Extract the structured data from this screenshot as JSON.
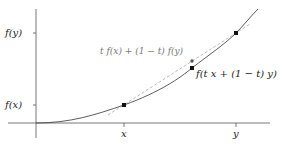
{
  "figure": {
    "axes": {
      "y_ticks": [
        {
          "label": "f(y)",
          "y": 33
        },
        {
          "label": "f(x)",
          "y": 105
        }
      ],
      "x_ticks": [
        {
          "label": "x",
          "x": 124
        },
        {
          "label": "y",
          "x": 236
        }
      ]
    },
    "annotations": {
      "chord_label": "t f(x) + (1 − t) f(y)",
      "curve_label": "f(t x + (1 − t) y)"
    },
    "points": [
      {
        "name": "x-fx",
        "x": 124,
        "y": 105
      },
      {
        "name": "y-fy",
        "x": 236,
        "y": 33
      },
      {
        "name": "chord-point",
        "x": 192,
        "y": 61
      },
      {
        "name": "curve-point",
        "x": 192,
        "y": 68
      }
    ],
    "colors": {
      "axis": "#555555",
      "curve": "#333333",
      "chord": "#aaaaaa",
      "point": "#111111"
    }
  }
}
